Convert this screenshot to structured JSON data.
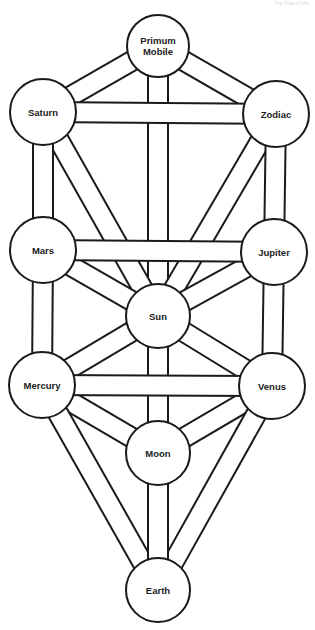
{
  "caption": "The Tree of Life",
  "diagram": {
    "type": "tree-of-life",
    "line_color": "#1a1a1a",
    "background": "#ffffff",
    "channel_width": 18,
    "nodes": [
      {
        "id": "primum",
        "label_lines": [
          "Primum",
          "Mobile"
        ],
        "x": 158,
        "y": 46,
        "r": 31
      },
      {
        "id": "saturn",
        "label_lines": [
          "Saturn"
        ],
        "x": 43,
        "y": 112,
        "r": 33
      },
      {
        "id": "zodiac",
        "label_lines": [
          "Zodiac"
        ],
        "x": 276,
        "y": 114,
        "r": 33
      },
      {
        "id": "mars",
        "label_lines": [
          "Mars"
        ],
        "x": 43,
        "y": 250,
        "r": 33
      },
      {
        "id": "jupiter",
        "label_lines": [
          "Jupiter"
        ],
        "x": 274,
        "y": 252,
        "r": 33
      },
      {
        "id": "sun",
        "label_lines": [
          "Sun"
        ],
        "x": 158,
        "y": 316,
        "r": 32
      },
      {
        "id": "mercury",
        "label_lines": [
          "Mercury"
        ],
        "x": 42,
        "y": 385,
        "r": 33
      },
      {
        "id": "venus",
        "label_lines": [
          "Venus"
        ],
        "x": 272,
        "y": 386,
        "r": 33
      },
      {
        "id": "moon",
        "label_lines": [
          "Moon"
        ],
        "x": 158,
        "y": 453,
        "r": 32
      },
      {
        "id": "earth",
        "label_lines": [
          "Earth"
        ],
        "x": 158,
        "y": 590,
        "r": 32
      }
    ],
    "channels": [
      [
        "primum",
        "sun"
      ],
      [
        "primum",
        "saturn"
      ],
      [
        "primum",
        "zodiac"
      ],
      [
        "saturn",
        "sun"
      ],
      [
        "zodiac",
        "sun"
      ],
      [
        "saturn",
        "mars"
      ],
      [
        "zodiac",
        "jupiter"
      ],
      [
        "saturn",
        "zodiac"
      ],
      [
        "mars",
        "sun"
      ],
      [
        "jupiter",
        "sun"
      ],
      [
        "mars",
        "mercury"
      ],
      [
        "jupiter",
        "venus"
      ],
      [
        "mars",
        "jupiter"
      ],
      [
        "sun",
        "moon"
      ],
      [
        "mercury",
        "sun"
      ],
      [
        "venus",
        "sun"
      ],
      [
        "mercury",
        "moon"
      ],
      [
        "venus",
        "moon"
      ],
      [
        "mercury",
        "earth"
      ],
      [
        "venus",
        "earth"
      ],
      [
        "moon",
        "earth"
      ],
      [
        "mercury",
        "venus"
      ]
    ]
  }
}
